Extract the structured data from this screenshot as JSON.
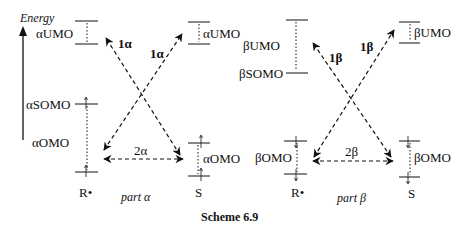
{
  "axis": {
    "label": "Energy"
  },
  "part_alpha": {
    "caption": "part α",
    "left_species": "R•",
    "right_species": "S",
    "left_levels": {
      "umo": "αUMO",
      "somo": "αSOMO",
      "omo": "αOMO"
    },
    "right_levels": {
      "umo": "αUMO",
      "omo": "αOMO"
    },
    "transitions": {
      "t1a": "1α",
      "t1b": "1α",
      "t2": "2α"
    }
  },
  "part_beta": {
    "caption": "part β",
    "left_species": "R•",
    "right_species": "S",
    "left_levels": {
      "umo": "βUMO",
      "somo": "βSOMO",
      "omo": "βOMO"
    },
    "right_levels": {
      "umo": "βUMO",
      "omo": "βOMO"
    },
    "transitions": {
      "t1a": "1β",
      "t1b": "1β",
      "t2": "2β"
    }
  },
  "caption": {
    "scheme": "Scheme 6.9"
  }
}
